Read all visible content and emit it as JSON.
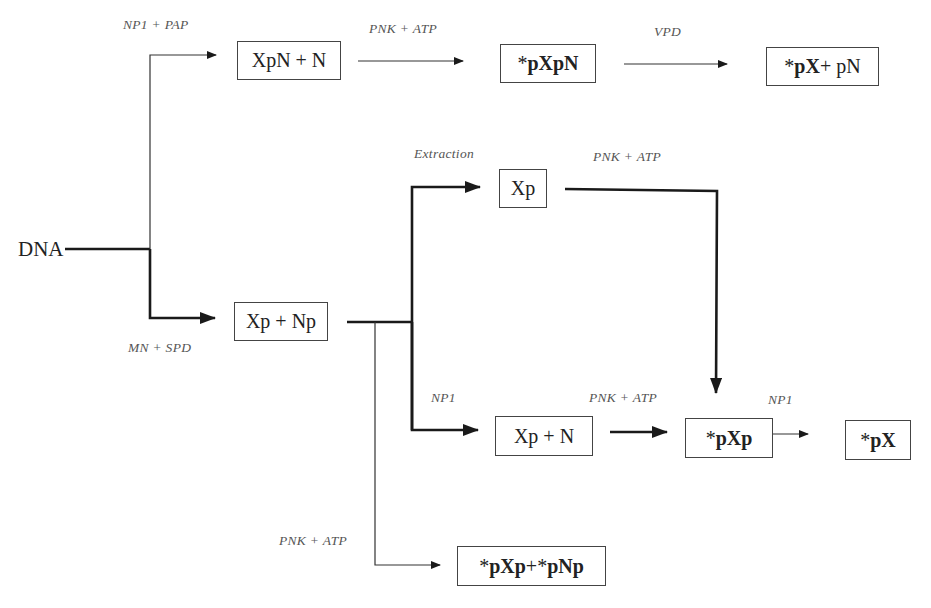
{
  "diagram": {
    "type": "flowchart",
    "start": "DNA",
    "nodes": {
      "xpn_n": {
        "parts": [
          {
            "t": "XpN + N",
            "bold": false
          }
        ]
      },
      "pxpn": {
        "parts": [
          {
            "t": "*",
            "bold": false
          },
          {
            "t": "pXpN",
            "bold": true
          }
        ]
      },
      "px_pn": {
        "parts": [
          {
            "t": "*",
            "bold": false
          },
          {
            "t": "pX",
            "bold": true
          },
          {
            "t": " + pN",
            "bold": false
          }
        ]
      },
      "xp_np": {
        "parts": [
          {
            "t": "Xp + Np",
            "bold": false
          }
        ]
      },
      "xp": {
        "parts": [
          {
            "t": "Xp",
            "bold": false
          }
        ]
      },
      "xp_n": {
        "parts": [
          {
            "t": "Xp + N",
            "bold": false
          }
        ]
      },
      "pxp": {
        "parts": [
          {
            "t": "*",
            "bold": false
          },
          {
            "t": "pXp",
            "bold": true
          }
        ]
      },
      "px": {
        "parts": [
          {
            "t": "*",
            "bold": false
          },
          {
            "t": "pX",
            "bold": true
          }
        ]
      },
      "pxp_pnp": {
        "parts": [
          {
            "t": "*",
            "bold": false
          },
          {
            "t": "pXp",
            "bold": true
          },
          {
            "t": " + ",
            "bold": false
          },
          {
            "t": "*",
            "bold": false
          },
          {
            "t": "pNp",
            "bold": true
          }
        ]
      }
    },
    "labels": {
      "np1_pap": "NP1 + PAP",
      "pnk_atp_top": "PNK + ATP",
      "vpd": "VPD",
      "mn_spd": "MN + SPD",
      "extraction": "Extraction",
      "pnk_atp_xp": "PNK + ATP",
      "np1_mid": "NP1",
      "pnk_atp_mid": "PNK + ATP",
      "np1_right": "NP1",
      "pnk_atp_bottom": "PNK + ATP"
    },
    "edges": [
      {
        "from": "DNA",
        "to": "xpn_n",
        "label": "NP1 + PAP"
      },
      {
        "from": "xpn_n",
        "to": "pxpn",
        "label": "PNK + ATP"
      },
      {
        "from": "pxpn",
        "to": "px_pn",
        "label": "VPD"
      },
      {
        "from": "DNA",
        "to": "xp_np",
        "label": "MN + SPD"
      },
      {
        "from": "xp_np",
        "to": "xp",
        "label": "Extraction"
      },
      {
        "from": "xp",
        "to": "pxp",
        "label": "PNK + ATP"
      },
      {
        "from": "xp_np",
        "to": "xp_n",
        "label": "NP1"
      },
      {
        "from": "xp_n",
        "to": "pxp",
        "label": "PNK + ATP"
      },
      {
        "from": "pxp",
        "to": "px",
        "label": "NP1"
      },
      {
        "from": "xp_np",
        "to": "pxp_pnp",
        "label": "PNK + ATP"
      }
    ]
  }
}
